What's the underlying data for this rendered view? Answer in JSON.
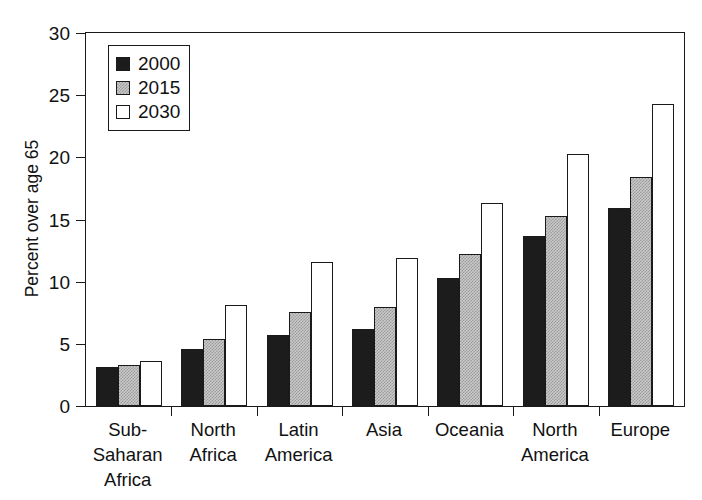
{
  "chart_data": {
    "type": "bar",
    "title": "",
    "subtitle": "",
    "xlabel": "",
    "ylabel": "Percent over age 65",
    "ylim": [
      0,
      30
    ],
    "yticks": [
      0,
      5,
      10,
      15,
      20,
      25,
      30
    ],
    "ytick_labels": [
      "0",
      "5",
      "10",
      "15",
      "20",
      "25",
      "30"
    ],
    "grid": false,
    "legend_position": "top-left",
    "categories": [
      "Sub-\nSaharan\nAfrica",
      "North\nAfrica",
      "Latin\nAmerica",
      "Asia",
      "Oceania",
      "North\nAmerica",
      "Europe"
    ],
    "series": [
      {
        "name": "2000",
        "color": "#1c1c1c",
        "values": [
          3.1,
          4.6,
          5.7,
          6.2,
          10.3,
          13.7,
          15.9
        ]
      },
      {
        "name": "2015",
        "color": "#c9c9c9",
        "values": [
          3.3,
          5.4,
          7.6,
          8.0,
          12.2,
          15.3,
          18.4
        ]
      },
      {
        "name": "2030",
        "color": "#ffffff",
        "values": [
          3.6,
          8.1,
          11.6,
          11.9,
          16.3,
          20.3,
          24.3
        ]
      }
    ]
  },
  "legend": {
    "entries": [
      {
        "label": "2000",
        "swatch": "black-square"
      },
      {
        "label": "2015",
        "swatch": "gray-square"
      },
      {
        "label": "2030",
        "swatch": "white-square"
      }
    ]
  }
}
